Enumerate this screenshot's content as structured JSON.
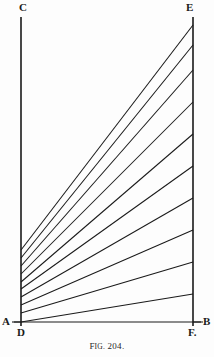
{
  "figure": {
    "caption_prefix_cap": "F",
    "caption_prefix_rest": "IG.",
    "caption_number": "204.",
    "background_color": "#fdfdfd",
    "line_color": "#1a1a1a",
    "width": 214,
    "height": 357
  },
  "labels": {
    "C": "C",
    "E": "E",
    "A": "A",
    "B": "B",
    "D": "D",
    "F": "F."
  },
  "chart_data": {
    "type": "line",
    "xlabel": "",
    "ylabel": "",
    "grid": false,
    "legend": "none",
    "points": {
      "C": [
        21,
        17
      ],
      "D": [
        21,
        322
      ],
      "A": [
        14,
        322
      ],
      "B": [
        203,
        322
      ],
      "E": [
        193,
        17
      ],
      "F": [
        193,
        330
      ]
    },
    "axis_lines": [
      {
        "name": "CD",
        "from": [
          21,
          17
        ],
        "to": [
          21,
          326
        ]
      },
      {
        "name": "EF",
        "from": [
          193,
          17
        ],
        "to": [
          193,
          326
        ]
      },
      {
        "name": "AB",
        "from": [
          14,
          322
        ],
        "to": [
          203,
          322
        ]
      }
    ],
    "fan_lines": [
      {
        "index": 1,
        "from": [
          21,
          322
        ],
        "to": [
          193,
          294
        ]
      },
      {
        "index": 2,
        "from": [
          21,
          313
        ],
        "to": [
          193,
          262
        ]
      },
      {
        "index": 3,
        "from": [
          21,
          305
        ],
        "to": [
          193,
          230
        ]
      },
      {
        "index": 4,
        "from": [
          21,
          297
        ],
        "to": [
          193,
          198
        ]
      },
      {
        "index": 5,
        "from": [
          21,
          289
        ],
        "to": [
          193,
          166
        ]
      },
      {
        "index": 6,
        "from": [
          21,
          282
        ],
        "to": [
          193,
          134
        ]
      },
      {
        "index": 7,
        "from": [
          21,
          274
        ],
        "to": [
          193,
          102
        ]
      },
      {
        "index": 8,
        "from": [
          21,
          266
        ],
        "to": [
          193,
          70
        ]
      },
      {
        "index": 9,
        "from": [
          21,
          258
        ],
        "to": [
          193,
          45
        ]
      },
      {
        "index": 10,
        "from": [
          21,
          250
        ],
        "to": [
          193,
          25
        ]
      }
    ],
    "tick_marks": [
      {
        "name": "A-tick",
        "from": [
          12,
          322
        ],
        "to": [
          21,
          322
        ]
      },
      {
        "name": "F-tick",
        "from": [
          193,
          322
        ],
        "to": [
          201,
          322
        ]
      }
    ]
  }
}
